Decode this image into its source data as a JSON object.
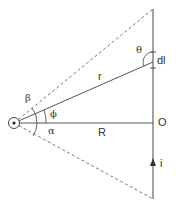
{
  "diagram": {
    "labels": {
      "beta": "β",
      "phi": "ϕ",
      "alpha": "α",
      "theta": "θ",
      "r": "r",
      "R": "R",
      "O": "O",
      "dl": "dl",
      "i": "i"
    },
    "colors": {
      "line": "#555555",
      "text": "#333333",
      "background": "#ffffff"
    },
    "geometry": {
      "point_P": [
        14,
        123
      ],
      "wire_x": 153,
      "wire_top_y": 9,
      "wire_bottom_y": 199,
      "dl_y": 62
    }
  }
}
